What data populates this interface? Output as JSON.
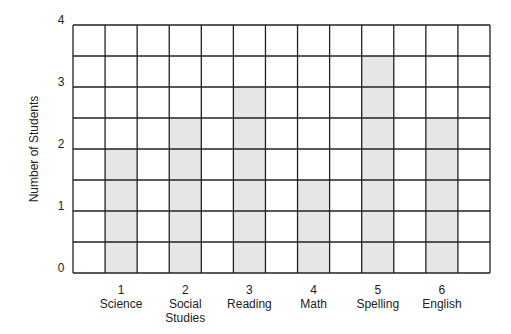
{
  "chart_data": {
    "type": "bar",
    "title": "",
    "xlabel": "",
    "ylabel": "Number of Students",
    "ylim": [
      0,
      4
    ],
    "yticks": [
      "0",
      "1",
      "2",
      "3",
      "4"
    ],
    "grid": true,
    "grid_columns": 13,
    "grid_rows": 8,
    "bar_color": "#e6e6e6",
    "grid_color": "#222222",
    "categories": [
      {
        "number": "1",
        "label": [
          "Science"
        ]
      },
      {
        "number": "2",
        "label": [
          "Social",
          "Studies"
        ]
      },
      {
        "number": "3",
        "label": [
          "Reading"
        ]
      },
      {
        "number": "4",
        "label": [
          "Math"
        ]
      },
      {
        "number": "5",
        "label": [
          "Spelling"
        ]
      },
      {
        "number": "6",
        "label": [
          "English"
        ]
      }
    ],
    "values": [
      2,
      2.5,
      3,
      1.5,
      3.5,
      2.5
    ]
  }
}
